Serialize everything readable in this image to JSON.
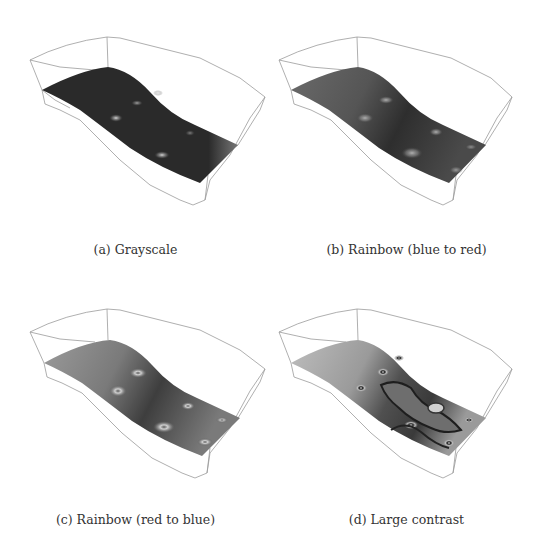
{
  "figure": {
    "panels": [
      {
        "id": "a",
        "caption": "(a) Grayscale",
        "colormap": "grayscale",
        "base_color": "#2a2a2a",
        "highlight_color": "#bdbdbd"
      },
      {
        "id": "b",
        "caption": "(b) Rainbow (blue to red)",
        "colormap": "rainbow-blue-to-red",
        "base_color": "#3a3a3a",
        "highlight_color": "#a8a8a8"
      },
      {
        "id": "c",
        "caption": "(c) Rainbow (red to blue)",
        "colormap": "rainbow-red-to-blue",
        "base_color": "#555555",
        "highlight_color": "#c8c8c8"
      },
      {
        "id": "d",
        "caption": "(d) Large contrast",
        "colormap": "large-contrast",
        "base_color": "#6a6a6a",
        "highlight_color": "#cfcfcf"
      }
    ],
    "box_outline_color": "#9a9a9a"
  }
}
